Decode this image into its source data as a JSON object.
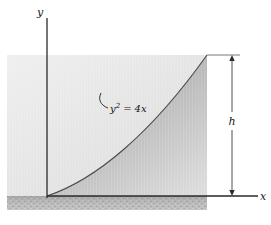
{
  "figure": {
    "type": "math-diagram",
    "width": 271,
    "height": 225,
    "background": "#ffffff"
  },
  "axes": {
    "y_label": "y",
    "x_label": "x",
    "origin": {
      "x": 47,
      "y": 196
    },
    "y_axis": {
      "x": 47,
      "y_top": 18,
      "y_bottom": 198
    },
    "x_axis": {
      "y": 196,
      "x_left": 47,
      "x_right": 258
    },
    "color": "#2b2b2b"
  },
  "curve": {
    "equation_label": "y² = 4x",
    "equation_base": "y",
    "equation_exponent": "2",
    "equation_operator": "=",
    "equation_right": "4x",
    "color": "#3a3a3a",
    "vertex": {
      "x": 47,
      "y": 196
    },
    "endpoint": {
      "x": 207,
      "y": 55
    }
  },
  "region": {
    "rect_left": 7,
    "rect_top": 55,
    "rect_right": 207,
    "rect_bottom": 196,
    "fill_outside_light": "#e9e9e9",
    "fill_inside_dark": "#b6b6b6"
  },
  "ground": {
    "top": 196,
    "bottom": 210,
    "left": 7,
    "right": 207,
    "fill": "#b3b3b3"
  },
  "dimension": {
    "label": "h",
    "line_x": 232,
    "top_y": 55,
    "bottom_y": 196,
    "color": "#2b2b2b",
    "extension_top_from": 207,
    "extension_bottom_from": 207
  },
  "leader": {
    "from": {
      "x": 108,
      "y": 108
    },
    "to": {
      "x": 101,
      "y": 93
    },
    "color": "#1a1a1a"
  }
}
